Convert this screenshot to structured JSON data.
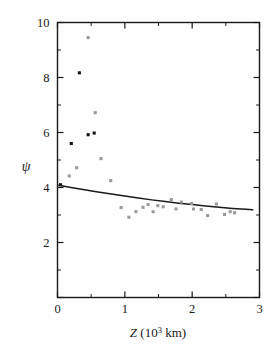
{
  "chart_data": {
    "type": "scatter",
    "title": "",
    "xlabel": "Z (10^3 km)",
    "xlabel_base": "Z (10",
    "xlabel_exp": "3",
    "xlabel_tail": " km)",
    "ylabel": "ψ",
    "xlim": [
      0,
      3
    ],
    "ylim": [
      0,
      10
    ],
    "grid": false,
    "legend": "none",
    "xticks": [
      0,
      1,
      2,
      3
    ],
    "xtick_labels": [
      "0",
      "1",
      "2",
      "3"
    ],
    "xminor_ticks": [
      0.5,
      1.5,
      2.5
    ],
    "yticks": [
      0,
      2,
      4,
      6,
      8,
      10
    ],
    "ytick_labels": [
      "",
      "2",
      "4",
      "6",
      "8",
      "10"
    ],
    "yminor_ticks": [
      1,
      3,
      5,
      7,
      9
    ],
    "series": [
      {
        "name": "filled-black-markers",
        "marker": "filled-square",
        "color": "#141414",
        "size": 3.1,
        "points": [
          {
            "x": 0.045,
            "y": 4.1
          },
          {
            "x": 0.205,
            "y": 5.6
          },
          {
            "x": 0.325,
            "y": 8.17
          },
          {
            "x": 0.455,
            "y": 5.92
          },
          {
            "x": 0.545,
            "y": 5.98
          }
        ]
      },
      {
        "name": "open-gray-markers",
        "marker": "gray-square",
        "color": "#9a9a9a",
        "size": 3.1,
        "points": [
          {
            "x": 0.175,
            "y": 4.42
          },
          {
            "x": 0.285,
            "y": 4.72
          },
          {
            "x": 0.455,
            "y": 9.45
          },
          {
            "x": 0.56,
            "y": 6.72
          },
          {
            "x": 0.645,
            "y": 5.05
          },
          {
            "x": 0.79,
            "y": 4.25
          },
          {
            "x": 0.945,
            "y": 3.27
          },
          {
            "x": 1.06,
            "y": 2.92
          },
          {
            "x": 1.165,
            "y": 3.12
          },
          {
            "x": 1.27,
            "y": 3.28
          },
          {
            "x": 1.345,
            "y": 3.38
          },
          {
            "x": 1.42,
            "y": 3.12
          },
          {
            "x": 1.49,
            "y": 3.34
          },
          {
            "x": 1.57,
            "y": 3.3
          },
          {
            "x": 1.69,
            "y": 3.56
          },
          {
            "x": 1.76,
            "y": 3.22
          },
          {
            "x": 1.84,
            "y": 3.47
          },
          {
            "x": 1.99,
            "y": 3.42
          },
          {
            "x": 2.02,
            "y": 3.22
          },
          {
            "x": 2.135,
            "y": 3.2
          },
          {
            "x": 2.23,
            "y": 2.98
          },
          {
            "x": 2.36,
            "y": 3.4
          },
          {
            "x": 2.48,
            "y": 3.02
          },
          {
            "x": 2.565,
            "y": 3.12
          },
          {
            "x": 2.63,
            "y": 3.08
          }
        ]
      }
    ],
    "fit_curve": {
      "name": "model-fit-line",
      "color": "#1a1a1a",
      "width": 1.5,
      "points": [
        {
          "x": 0.02,
          "y": 4.08
        },
        {
          "x": 0.2,
          "y": 4.0
        },
        {
          "x": 0.4,
          "y": 3.92
        },
        {
          "x": 0.6,
          "y": 3.84
        },
        {
          "x": 0.8,
          "y": 3.76
        },
        {
          "x": 1.0,
          "y": 3.69
        },
        {
          "x": 1.2,
          "y": 3.62
        },
        {
          "x": 1.4,
          "y": 3.55
        },
        {
          "x": 1.6,
          "y": 3.49
        },
        {
          "x": 1.8,
          "y": 3.43
        },
        {
          "x": 2.0,
          "y": 3.38
        },
        {
          "x": 2.2,
          "y": 3.33
        },
        {
          "x": 2.4,
          "y": 3.28
        },
        {
          "x": 2.6,
          "y": 3.24
        },
        {
          "x": 2.8,
          "y": 3.21
        },
        {
          "x": 2.9,
          "y": 3.19
        }
      ]
    }
  }
}
